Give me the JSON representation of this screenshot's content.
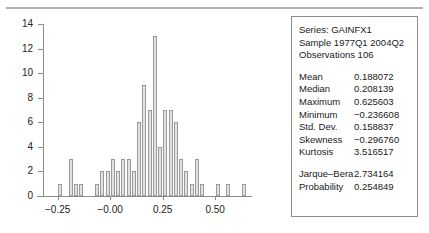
{
  "chart_data": {
    "type": "bar",
    "title": "",
    "xlabel": "",
    "ylabel": "",
    "ylim": [
      0,
      14
    ],
    "xlim": [
      -0.32,
      0.68
    ],
    "grid": false,
    "legend": "none",
    "y_ticks": [
      0,
      2,
      4,
      6,
      8,
      10,
      12,
      14
    ],
    "y_tick_labels": [
      "0",
      "2",
      "4",
      "6",
      "8",
      "10",
      "12",
      "14"
    ],
    "x_ticks": [
      -0.25,
      -0.0,
      0.25,
      0.5
    ],
    "x_tick_labels": [
      "−0.25",
      "−0.00",
      "0.25",
      "0.50"
    ],
    "bin_width": 0.025,
    "bin_centers": [
      -0.2375,
      -0.2125,
      -0.1875,
      -0.1625,
      -0.1375,
      -0.1125,
      -0.0875,
      -0.0625,
      -0.0375,
      -0.0125,
      0.0125,
      0.0375,
      0.0625,
      0.0875,
      0.1125,
      0.1375,
      0.1625,
      0.1875,
      0.2125,
      0.2375,
      0.2625,
      0.2875,
      0.3125,
      0.3375,
      0.3625,
      0.3875,
      0.4125,
      0.4375,
      0.4625,
      0.4875,
      0.5125,
      0.5375,
      0.5625,
      0.5875,
      0.6125,
      0.6375
    ],
    "categories": [
      "-0.2375",
      "-0.2125",
      "-0.1875",
      "-0.1625",
      "-0.1375",
      "-0.1125",
      "-0.0875",
      "-0.0625",
      "-0.0375",
      "-0.0125",
      "0.0125",
      "0.0375",
      "0.0625",
      "0.0875",
      "0.1125",
      "0.1375",
      "0.1625",
      "0.1875",
      "0.2125",
      "0.2375",
      "0.2625",
      "0.2875",
      "0.3125",
      "0.3375",
      "0.3625",
      "0.3875",
      "0.4125",
      "0.4375",
      "0.4625",
      "0.4875",
      "0.5125",
      "0.5375",
      "0.5625",
      "0.5875",
      "0.6125",
      "0.6375"
    ],
    "values": [
      1,
      0,
      3,
      1,
      1,
      0,
      0,
      1,
      2,
      2,
      3,
      2,
      3,
      3,
      2,
      6,
      9,
      7,
      13,
      4,
      7,
      7,
      6,
      3,
      2,
      1,
      3,
      1,
      0,
      0,
      1,
      0,
      1,
      0,
      0,
      1
    ]
  },
  "stats_box": {
    "series_line": "Series: GAINFX1",
    "sample_line": "Sample 1977Q1 2004Q2",
    "observations_line": "Observations 106",
    "rows": [
      {
        "name": "Mean",
        "value": "0.188072"
      },
      {
        "name": "Median",
        "value": "0.208139"
      },
      {
        "name": "Maximum",
        "value": "0.625603"
      },
      {
        "name": "Minimum",
        "value": "−0.236608"
      },
      {
        "name": "Std. Dev.",
        "value": "0.158837"
      },
      {
        "name": "Skewness",
        "value": "−0.296760"
      },
      {
        "name": "Kurtosis",
        "value": "3.516517"
      }
    ],
    "test_rows": [
      {
        "name": "Jarque–Bera",
        "value": "2.734164"
      },
      {
        "name": "Probability",
        "value": "0.254849"
      }
    ]
  },
  "colors": {
    "bar_fill": "#e2e2e2",
    "bar_edge": "#9a9a9a",
    "axis": "#8a8a8a",
    "text": "#1a1a1a",
    "box_border": "#8d8d8d",
    "background": "#ffffff"
  }
}
